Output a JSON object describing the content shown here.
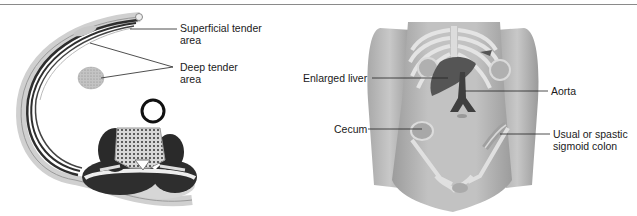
{
  "figure": {
    "panels": [
      {
        "id": "cross-section",
        "description": "Transverse section of trunk showing abdominal wall and lumbar vertebra",
        "labels": [
          {
            "text_line1": "Superficial tender",
            "text_line2": "area"
          },
          {
            "text_line1": "Deep tender",
            "text_line2": "area"
          }
        ]
      },
      {
        "id": "anterior-torso",
        "description": "Anterior view of torso with abdominal organs",
        "labels": [
          {
            "text": "Enlarged liver"
          },
          {
            "text": "Aorta"
          },
          {
            "text": "Cecum"
          },
          {
            "text_line1": "Usual or spastic",
            "text_line2": "sigmoid colon"
          }
        ]
      }
    ],
    "colors": {
      "rule": "#8a8a8a",
      "text": "#1a1a1a",
      "skin": "#b9b9b9",
      "skin_dark": "#8f8f8f",
      "bone": "#e2e2e2",
      "muscle_dark": "#2e2e2e",
      "organ": "#555555"
    }
  }
}
